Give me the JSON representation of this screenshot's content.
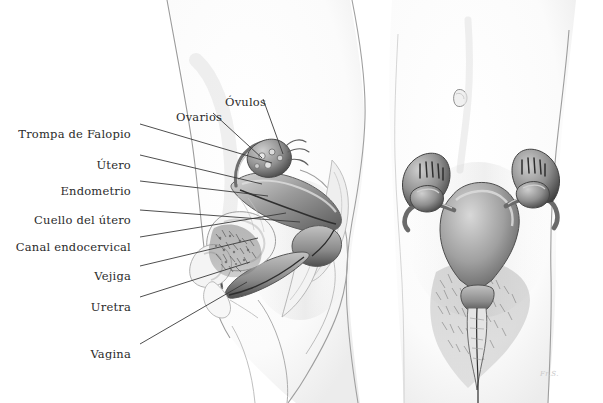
{
  "illustration": {
    "title": "Anatomia del aparato reproductor femenino",
    "views": [
      {
        "name": "sagittal-view",
        "description": "Vista lateral (sagital) de la pelvis femenina"
      },
      {
        "name": "frontal-view",
        "description": "Vista frontal del utero, trompas de Falopio y ovarios"
      }
    ],
    "signature": "Fr.S."
  },
  "labels": [
    {
      "id": "ovarios",
      "text": "Ovarios",
      "x": 176,
      "y": 110,
      "align": "left",
      "line": {
        "x1": 213,
        "y1": 113,
        "x2": 262,
        "y2": 158
      }
    },
    {
      "id": "ovulos",
      "text": "Óvulos",
      "x": 225,
      "y": 95,
      "align": "left",
      "line": {
        "x1": 263,
        "y1": 99,
        "x2": 283,
        "y2": 154
      }
    },
    {
      "id": "trompa-de-falopio",
      "text": "Trompa de Falopio",
      "x": 131,
      "y": 127,
      "align": "right",
      "line": {
        "x1": 140,
        "y1": 124,
        "x2": 272,
        "y2": 163
      }
    },
    {
      "id": "utero",
      "text": "Útero",
      "x": 131,
      "y": 158,
      "align": "right",
      "line": {
        "x1": 140,
        "y1": 155,
        "x2": 262,
        "y2": 184
      }
    },
    {
      "id": "endometrio",
      "text": "Endometrio",
      "x": 131,
      "y": 184,
      "align": "right",
      "line": {
        "x1": 140,
        "y1": 181,
        "x2": 268,
        "y2": 196
      }
    },
    {
      "id": "cuello-del-utero",
      "text": "Cuello del útero",
      "x": 131,
      "y": 213,
      "align": "right",
      "line": {
        "x1": 140,
        "y1": 210,
        "x2": 300,
        "y2": 222
      }
    },
    {
      "id": "canal-endocervical",
      "text": "Canal endocervical",
      "x": 131,
      "y": 240,
      "align": "right",
      "line": {
        "x1": 140,
        "y1": 237,
        "x2": 286,
        "y2": 213
      }
    },
    {
      "id": "vejiga",
      "text": "Vejiga",
      "x": 131,
      "y": 269,
      "align": "right",
      "line": {
        "x1": 140,
        "y1": 266,
        "x2": 258,
        "y2": 238
      }
    },
    {
      "id": "uretra",
      "text": "Uretra",
      "x": 131,
      "y": 300,
      "align": "right",
      "line": {
        "x1": 140,
        "y1": 297,
        "x2": 250,
        "y2": 262
      }
    },
    {
      "id": "vagina",
      "text": "Vagina",
      "x": 131,
      "y": 347,
      "align": "right",
      "line": {
        "x1": 140,
        "y1": 344,
        "x2": 247,
        "y2": 282
      }
    }
  ],
  "colors": {
    "text": "#2b2b2b",
    "leader_line": "#3a3a3a",
    "background": "#ffffff",
    "skin_outline": "#8e8e8e",
    "organ_dark": "#4a4a4a",
    "organ_mid": "#8a8a8a",
    "organ_light": "#c8c8c8"
  }
}
